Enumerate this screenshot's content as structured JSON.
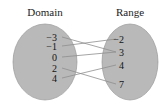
{
  "figure": {
    "type": "mapping-diagram",
    "background_color": "#ffffff",
    "ellipse_fill": "#b9b9b9",
    "ellipse_stroke": "#9a9a9a",
    "line_color": "#8e8e8e",
    "text_color": "#141414"
  },
  "domain": {
    "title": "Domain",
    "elements": [
      {
        "label": "−3",
        "cx": 57,
        "cy": 37
      },
      {
        "label": "−1",
        "cx": 57,
        "cy": 46
      },
      {
        "label": "0",
        "cx": 57,
        "cy": 57
      },
      {
        "label": "2",
        "cx": 57,
        "cy": 68
      },
      {
        "label": "4",
        "cx": 57,
        "cy": 78
      }
    ],
    "ellipse": {
      "cx": 45,
      "cy": 62,
      "rx": 32,
      "ry": 38
    }
  },
  "range": {
    "title": "Range",
    "elements": [
      {
        "label": "−2",
        "cx": 124,
        "cy": 39
      },
      {
        "label": "3",
        "cx": 124,
        "cy": 52
      },
      {
        "label": "4",
        "cx": 124,
        "cy": 65
      },
      {
        "label": "7",
        "cx": 124,
        "cy": 84
      }
    ],
    "ellipse": {
      "cx": 130,
      "cy": 62,
      "rx": 28,
      "ry": 38
    }
  },
  "mappings": [
    {
      "from": "−3",
      "to": "3",
      "x1": 62,
      "y1": 37,
      "x2": 116,
      "y2": 52
    },
    {
      "from": "−1",
      "to": "−2",
      "x1": 62,
      "y1": 46,
      "x2": 116,
      "y2": 39
    },
    {
      "from": "0",
      "to": "3",
      "x1": 62,
      "y1": 57,
      "x2": 116,
      "y2": 52
    },
    {
      "from": "2",
      "to": "7",
      "x1": 62,
      "y1": 68,
      "x2": 116,
      "y2": 84
    },
    {
      "from": "4",
      "to": "4",
      "x1": 62,
      "y1": 78,
      "x2": 116,
      "y2": 65
    }
  ]
}
